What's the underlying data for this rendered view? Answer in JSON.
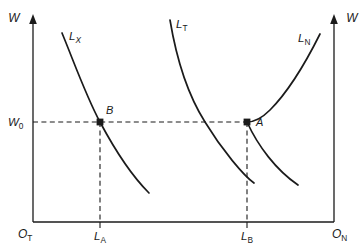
{
  "figure": {
    "type": "economics-diagram",
    "background_color": "#ffffff",
    "line_color": "#1b1b1b"
  },
  "axes": {
    "left_vertical": {
      "label": "W",
      "arrow": "up",
      "x": 33,
      "y_top": 18,
      "y_bottom": 222
    },
    "right_vertical": {
      "label": "W",
      "arrow": "up",
      "x": 334,
      "y_top": 18,
      "y_bottom": 222
    },
    "horizontal": {
      "y": 222,
      "x_left": 33,
      "x_right": 334
    },
    "origin_left": {
      "base": "O",
      "subscript": "T"
    },
    "origin_right": {
      "base": "O",
      "subscript": "N"
    }
  },
  "value_markers": {
    "wage": {
      "base": "W",
      "subscript": "0",
      "y": 122,
      "label_x": 8
    },
    "labour_a": {
      "base": "L",
      "subscript": "A",
      "x": 100,
      "label_y": 240
    },
    "labour_b": {
      "base": "L",
      "subscript": "B",
      "x": 247,
      "label_y": 240
    }
  },
  "curves": [
    {
      "id": "lx",
      "base": "L",
      "subscript": "X",
      "label_x": 69,
      "label_y": 40,
      "shape": "downward-sloping-convex",
      "path": "M 62,33 C 74,62 86,96 100,122 C 116,152 134,178 149,193",
      "orientation": "left-origin"
    },
    {
      "id": "lt",
      "base": "L",
      "subscript": "T",
      "label_x": 176,
      "label_y": 28,
      "shape": "v-shaped-pair",
      "path_left": "M 170,20 C 176,56 186,92 205,122 C 222,150 244,176 254,183",
      "path_right": "M 247,122 C 258,146 276,170 298,185",
      "orientation": "center"
    },
    {
      "id": "ln",
      "base": "L",
      "subscript": "N",
      "label_x": 298,
      "label_y": 42,
      "shape": "upward-sloping-from-right",
      "path": "M 320,34 C 306,62 288,92 270,110 C 260,120 252,122 247,122",
      "orientation": "right-origin"
    }
  ],
  "points": [
    {
      "id": "point-b",
      "label": "B",
      "x": 100,
      "y": 122,
      "label_x": 106,
      "label_y": 114
    },
    {
      "id": "point-a",
      "label": "A",
      "x": 247,
      "y": 122,
      "label_x": 256,
      "label_y": 126
    }
  ],
  "guides": {
    "horizontal_wage_line": {
      "y": 122,
      "x_start": 33,
      "x_end": 250
    },
    "vertical_from_b": {
      "x": 100,
      "y_start": 122,
      "y_end": 222
    },
    "vertical_from_a": {
      "x": 247,
      "y_start": 122,
      "y_end": 222
    }
  }
}
